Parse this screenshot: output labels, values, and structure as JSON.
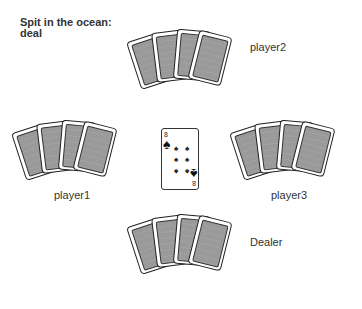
{
  "title": {
    "line1": "Spit in the ocean:",
    "line2": "deal"
  },
  "players": {
    "player2": {
      "label": "player2",
      "cards_face_down": 4
    },
    "player1": {
      "label": "player1",
      "cards_face_down": 4
    },
    "player3": {
      "label": "player3",
      "cards_face_down": 4
    },
    "dealer": {
      "label": "Dealer",
      "cards_face_down": 4
    }
  },
  "center_card": {
    "rank": "8",
    "suit": "spades",
    "suit_glyph": "♠"
  },
  "colors": {
    "card_back": "#9a9a9a",
    "card_border": "#222222",
    "text": "#333333"
  }
}
